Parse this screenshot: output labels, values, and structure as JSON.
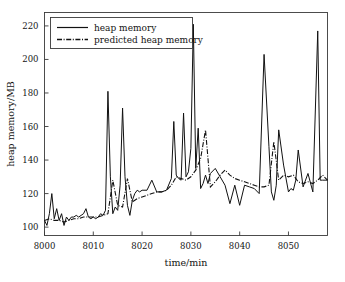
{
  "chart_data": {
    "type": "line",
    "title": "",
    "xlabel": "time/min",
    "ylabel": "heap memory/MB",
    "xlim": [
      8000,
      8058
    ],
    "ylim": [
      95,
      228
    ],
    "xticks": [
      8000,
      8010,
      8020,
      8030,
      8040,
      8050
    ],
    "yticks": [
      100,
      120,
      140,
      160,
      180,
      200,
      220
    ],
    "grid": false,
    "legend_position": "upper-left",
    "series": [
      {
        "name": "heap memory",
        "style": "solid",
        "color": "#111111",
        "x": [
          8000,
          8000.5,
          8001,
          8001.5,
          8002,
          8002.5,
          8003,
          8003.5,
          8004,
          8004.5,
          8005,
          8005.5,
          8006,
          8006.5,
          8007,
          8007.5,
          8008,
          8008.5,
          8009,
          8009.5,
          8010,
          8010.5,
          8011,
          8011.5,
          8012,
          8012.5,
          8013,
          8013.5,
          8014,
          8014.5,
          8015,
          8015.5,
          8016,
          8016.5,
          8017,
          8017.5,
          8018,
          8018.5,
          8019,
          8019.5,
          8020,
          8021,
          8022,
          8023,
          8024,
          8025,
          8026,
          8026.5,
          8027,
          8027.5,
          8028,
          8028.5,
          8029,
          8029.5,
          8030,
          8030.5,
          8031,
          8031.5,
          8032,
          8032.5,
          8033,
          8033.5,
          8034,
          8035,
          8036,
          8037,
          8038,
          8039,
          8040,
          8041,
          8042,
          8043,
          8044,
          8045,
          8046,
          8046.5,
          8047,
          8047.5,
          8048,
          8049,
          8050,
          8050.5,
          8051,
          8051.5,
          8052,
          8053,
          8054,
          8055,
          8056,
          8056.5,
          8057,
          8057.5,
          8058
        ],
        "y": [
          104,
          101,
          108,
          120,
          105,
          111,
          104,
          108,
          101,
          106,
          104,
          106,
          106,
          107,
          106,
          107,
          108,
          111,
          106,
          105,
          106,
          105,
          106,
          108,
          107,
          110,
          181,
          130,
          108,
          112,
          110,
          125,
          171,
          130,
          113,
          107,
          116,
          120,
          122,
          121,
          122,
          122,
          128,
          121,
          121,
          122,
          129,
          163,
          131,
          129,
          128,
          168,
          130,
          133,
          147,
          221,
          135,
          159,
          123,
          126,
          131,
          126,
          132,
          135,
          130,
          125,
          114,
          125,
          113,
          125,
          124,
          123,
          120,
          203,
          148,
          121,
          116,
          125,
          158,
          137,
          121,
          123,
          122,
          128,
          146,
          124,
          132,
          121,
          217,
          128,
          128,
          128,
          128
        ]
      },
      {
        "name": "predicted heap memory",
        "style": "dashdot",
        "color": "#111111",
        "x": [
          8000,
          8001,
          8002,
          8003,
          8004,
          8005,
          8006,
          8007,
          8008,
          8009,
          8010,
          8011,
          8012,
          8013,
          8014,
          8015,
          8016,
          8017,
          8018,
          8019,
          8020,
          8021,
          8022,
          8023,
          8024,
          8025,
          8026,
          8027,
          8028,
          8029,
          8030,
          8031,
          8032,
          8033,
          8034,
          8035,
          8036,
          8037,
          8038,
          8039,
          8040,
          8041,
          8042,
          8043,
          8044,
          8045,
          8046,
          8047,
          8048,
          8049,
          8050,
          8051,
          8052,
          8053,
          8054,
          8055,
          8056,
          8057,
          8058
        ],
        "y": [
          104,
          105,
          104,
          104,
          103,
          104,
          105,
          105,
          106,
          106,
          106,
          106,
          107,
          108,
          128,
          113,
          112,
          129,
          115,
          117,
          118,
          119,
          120,
          121,
          121,
          122,
          125,
          130,
          129,
          128,
          130,
          134,
          141,
          158,
          124,
          127,
          131,
          134,
          131,
          129,
          128,
          127,
          126,
          125,
          124,
          124,
          125,
          151,
          128,
          131,
          130,
          131,
          127,
          126,
          127,
          126,
          128,
          131,
          128
        ]
      }
    ]
  },
  "legend": {
    "entries": [
      {
        "label": "heap memory",
        "style": "solid"
      },
      {
        "label": "predicted heap memory",
        "style": "dashdot"
      }
    ]
  },
  "axes": {
    "x_title": "time/min",
    "y_title": "heap memory/MB",
    "x_tick_labels": [
      "8000",
      "8010",
      "8020",
      "8030",
      "8040",
      "8050"
    ],
    "y_tick_labels": [
      "100",
      "120",
      "140",
      "160",
      "180",
      "200",
      "220"
    ]
  }
}
